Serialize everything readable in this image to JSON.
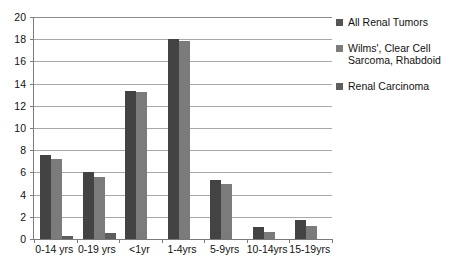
{
  "chart_data": {
    "type": "bar",
    "title": "",
    "xlabel": "",
    "ylabel": "",
    "ylim": [
      0,
      20
    ],
    "ytick_step": 2,
    "grid": true,
    "legend_position": "right",
    "categories": [
      "0-14 yrs",
      "0-19 yrs",
      "<1yr",
      "1-4yrs",
      "5-9yrs",
      "10-14yrs",
      "15-19yrs"
    ],
    "yticks": [
      "20",
      "18",
      "16",
      "14",
      "12",
      "10",
      "8",
      "6",
      "4",
      "2",
      "0"
    ],
    "series": [
      {
        "name": "All Renal Tumors",
        "color": "#434343",
        "values": [
          7.6,
          6.0,
          13.3,
          18.0,
          5.3,
          1.1,
          1.7
        ]
      },
      {
        "name": "Wilms', Clear Cell Sarcoma, Rhabdoid",
        "color": "#7b7b7b",
        "values": [
          7.2,
          5.6,
          13.2,
          17.8,
          5.0,
          0.6,
          1.2
        ]
      },
      {
        "name": "Renal Carcinoma",
        "color": "#5e5e5e",
        "values": [
          0.25,
          0.5,
          0,
          0,
          0,
          0,
          0
        ]
      }
    ]
  },
  "legend": {
    "items": [
      {
        "label": "All Renal Tumors"
      },
      {
        "label": "Wilms', Clear Cell Sarcoma, Rhabdoid"
      },
      {
        "label": "Renal Carcinoma"
      }
    ]
  }
}
